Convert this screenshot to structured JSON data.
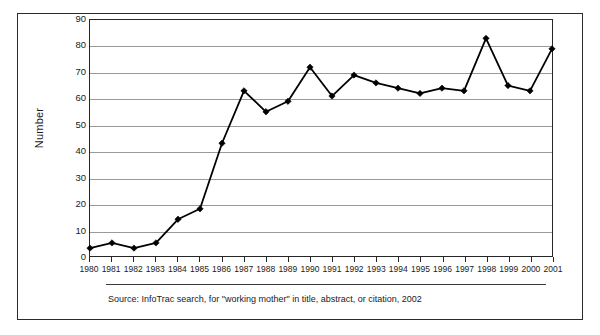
{
  "figure": {
    "source_note": "Source: InfoTrac search, for \"working mother\" in title, abstract, or citation, 2002"
  },
  "chart_data": {
    "type": "line",
    "title": "",
    "xlabel": "",
    "ylabel": "Number",
    "categories": [
      "1980",
      "1981",
      "1982",
      "1983",
      "1984",
      "1985",
      "1986",
      "1987",
      "1988",
      "1989",
      "1990",
      "1991",
      "1992",
      "1993",
      "1994",
      "1995",
      "1996",
      "1997",
      "1998",
      "1999",
      "2000",
      "2001"
    ],
    "values": [
      3,
      5,
      3,
      5,
      14,
      18,
      43,
      63,
      55,
      59,
      72,
      61,
      69,
      66,
      64,
      62,
      64,
      63,
      83,
      65,
      63,
      79
    ],
    "ylim": [
      0,
      90
    ],
    "yticks": [
      0,
      10,
      20,
      30,
      40,
      50,
      60,
      70,
      80,
      90
    ],
    "grid": true,
    "legend": false,
    "marker": "diamond",
    "line_color": "#000000",
    "marker_color": "#000000",
    "grid_color": "#9a9a9a"
  }
}
